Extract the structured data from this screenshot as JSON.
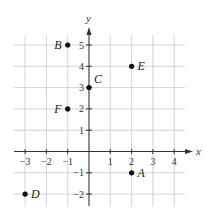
{
  "chart_data": {
    "type": "scatter",
    "title": "",
    "xlabel": "x",
    "ylabel": "y",
    "xlim": [
      -3.5,
      4.5
    ],
    "ylim": [
      -2.5,
      5.5
    ],
    "grid": true,
    "x_ticks": [
      -3,
      -2,
      -1,
      1,
      2,
      3,
      4
    ],
    "y_ticks": [
      -2,
      -1,
      1,
      2,
      3,
      4,
      5
    ],
    "points": [
      {
        "label": "A",
        "x": 2,
        "y": -1,
        "label_side": "right"
      },
      {
        "label": "B",
        "x": -1,
        "y": 5,
        "label_side": "left"
      },
      {
        "label": "C",
        "x": 0,
        "y": 3,
        "label_side": "upper-right"
      },
      {
        "label": "D",
        "x": -3,
        "y": -2,
        "label_side": "right"
      },
      {
        "label": "E",
        "x": 2,
        "y": 4,
        "label_side": "right"
      },
      {
        "label": "F",
        "x": -1,
        "y": 2,
        "label_side": "left"
      }
    ]
  }
}
